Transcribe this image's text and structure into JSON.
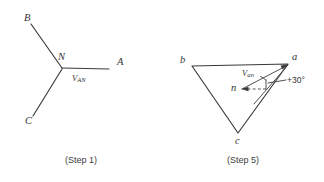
{
  "figure": {
    "type": "engineering-diagram",
    "panels": [
      {
        "id": "step1",
        "caption": "(Step 1)",
        "kind": "wye-connection",
        "center_node_label": "N",
        "terminals": [
          {
            "label": "B",
            "direction": "upper-left"
          },
          {
            "label": "C",
            "direction": "lower-left"
          },
          {
            "label": "A",
            "direction": "right"
          }
        ],
        "vector_label_main": "V",
        "vector_label_sub": "AN"
      },
      {
        "id": "step5",
        "caption": "(Step 5)",
        "kind": "phasor-triangle",
        "vertices": [
          {
            "label": "b",
            "position": "upper-left"
          },
          {
            "label": "a",
            "position": "upper-right"
          },
          {
            "label": "c",
            "position": "bottom"
          }
        ],
        "interior_point_label": "n",
        "vector_label_main": "V",
        "vector_label_sub": "an",
        "angle_annotation": "+30°",
        "reference_line": "horizontal-dashed"
      }
    ]
  },
  "colors": {
    "background": "#ffffff",
    "line": "#3a3a3a",
    "text": "#333333",
    "caption": "#3d3d3d"
  }
}
